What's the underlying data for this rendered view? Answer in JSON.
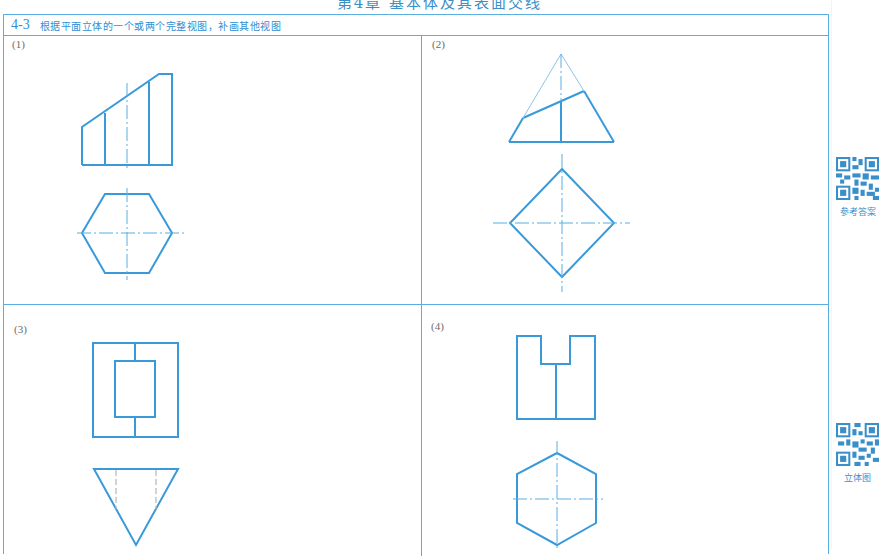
{
  "page": {
    "chapter_title": "第4章 基本体及其表面交线",
    "exercise": {
      "number": "4-3",
      "instruction": "根据平面立体的一个或两个完整视图，补画其他视图"
    },
    "panels": [
      {
        "label": "(1)"
      },
      {
        "label": "(2)"
      },
      {
        "label": "(3)"
      },
      {
        "label": "(4)"
      }
    ],
    "qr_codes": [
      {
        "caption": "参考答案",
        "icon": "qr-code-icon"
      },
      {
        "caption": "立体图",
        "icon": "qr-code-icon"
      }
    ]
  },
  "colors": {
    "line": "#3a9ad9",
    "border": "#5aaee0",
    "text_accent": "#2f8fd2",
    "label_gray": "#6b6b6b"
  }
}
